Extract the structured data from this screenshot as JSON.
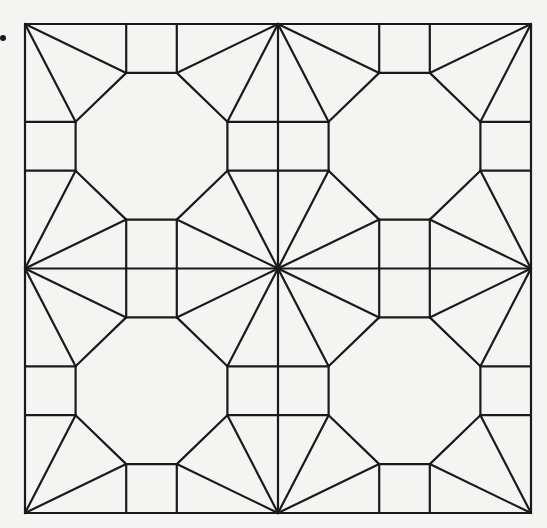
{
  "figure": {
    "type": "geometric-tiling",
    "stroke_color": "#1a1a1a",
    "background_color": "#f4f4f2",
    "stroke_width": 2.2,
    "outer_square": {
      "x0": 25,
      "y0": 24,
      "x1": 531,
      "y1": 513
    },
    "grid": {
      "rows": 2,
      "cols": 2
    },
    "quadrant_motif": {
      "octagon_vertices_normalized": [
        [
          0.4,
          0.2
        ],
        [
          0.6,
          0.2
        ],
        [
          0.8,
          0.4
        ],
        [
          0.8,
          0.6
        ],
        [
          0.6,
          0.8
        ],
        [
          0.4,
          0.8
        ],
        [
          0.2,
          0.6
        ],
        [
          0.2,
          0.4
        ]
      ],
      "edge_square_start": 0.4,
      "edge_square_end": 0.6,
      "edge_square_depth": 0.2
    },
    "bullet": {
      "x": 3,
      "y": 38
    }
  }
}
